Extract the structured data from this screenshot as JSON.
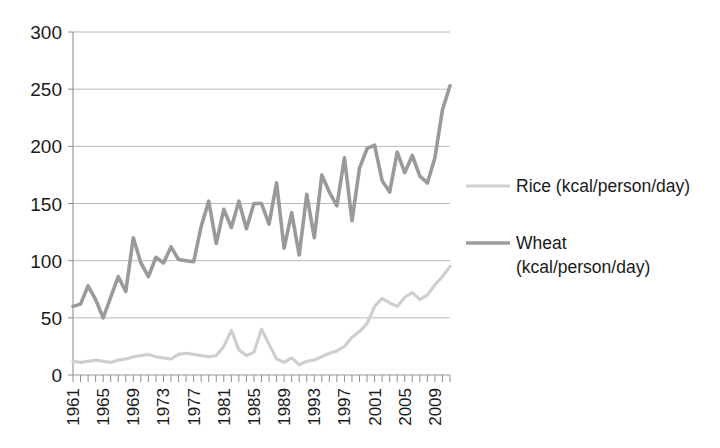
{
  "chart_data": {
    "type": "line",
    "title": "",
    "subtitle": "",
    "xlabel": "",
    "ylabel": "",
    "grid": "horizontal",
    "legend_position": "right",
    "ylim": [
      0,
      300
    ],
    "ytick_values": [
      0,
      50,
      100,
      150,
      200,
      250,
      300
    ],
    "ytick_labels": [
      "0",
      "50",
      "100",
      "150",
      "200",
      "250",
      "300"
    ],
    "xlim": [
      1961,
      2011
    ],
    "x": [
      1961,
      1962,
      1963,
      1964,
      1965,
      1966,
      1967,
      1968,
      1969,
      1970,
      1971,
      1972,
      1973,
      1974,
      1975,
      1976,
      1977,
      1978,
      1979,
      1980,
      1981,
      1982,
      1983,
      1984,
      1985,
      1986,
      1987,
      1988,
      1989,
      1990,
      1991,
      1992,
      1993,
      1994,
      1995,
      1996,
      1997,
      1998,
      1999,
      2000,
      2001,
      2002,
      2003,
      2004,
      2005,
      2006,
      2007,
      2008,
      2009,
      2010,
      2011
    ],
    "xtick_labels": [
      "1961",
      "1965",
      "1969",
      "1973",
      "1977",
      "1981",
      "1985",
      "1989",
      "1993",
      "1997",
      "2001",
      "2005",
      "2009"
    ],
    "xtick_values": [
      1961,
      1965,
      1969,
      1973,
      1977,
      1981,
      1985,
      1989,
      1993,
      1997,
      2001,
      2005,
      2009
    ],
    "xtick_rotation": 90,
    "series": [
      {
        "name": "Rice (kcal/person/day)",
        "color": "#cfcfcf",
        "stroke_width": 3.2,
        "values": [
          12,
          11,
          12,
          13,
          12,
          11,
          13,
          14,
          16,
          17,
          18,
          16,
          15,
          14,
          18,
          19,
          18,
          17,
          16,
          17,
          25,
          39,
          22,
          17,
          20,
          40,
          27,
          14,
          11,
          15,
          9,
          12,
          13,
          16,
          19,
          21,
          25,
          33,
          38,
          45,
          60,
          67,
          63,
          60,
          68,
          72,
          66,
          70,
          79,
          86,
          95
        ]
      },
      {
        "name": "Wheat (kcal/person/day)",
        "color": "#9a9a9a",
        "stroke_width": 3.6,
        "values": [
          60,
          62,
          78,
          66,
          50,
          68,
          86,
          73,
          120,
          98,
          86,
          103,
          98,
          112,
          101,
          100,
          99,
          130,
          152,
          115,
          145,
          129,
          152,
          128,
          150,
          150,
          132,
          168,
          111,
          142,
          105,
          158,
          120,
          175,
          160,
          148,
          190,
          135,
          181,
          198,
          201,
          170,
          160,
          195,
          177,
          192,
          174,
          168,
          190,
          232,
          253
        ]
      }
    ]
  },
  "legend": {
    "items": [
      {
        "label": "Rice (kcal/person/day)",
        "label_line1": "Rice (kcal/person/day)",
        "label_line2": "",
        "color": "#cfcfcf"
      },
      {
        "label": "Wheat (kcal/person/day)",
        "label_line1": "Wheat",
        "label_line2": "(kcal/person/day)",
        "color": "#9a9a9a"
      }
    ]
  },
  "colors": {
    "background": "#ffffff",
    "gridline": "#b8b8b8",
    "axis": "#9a9a9a",
    "text": "#1a1a1a",
    "rice": "#cfcfcf",
    "wheat": "#9a9a9a"
  }
}
